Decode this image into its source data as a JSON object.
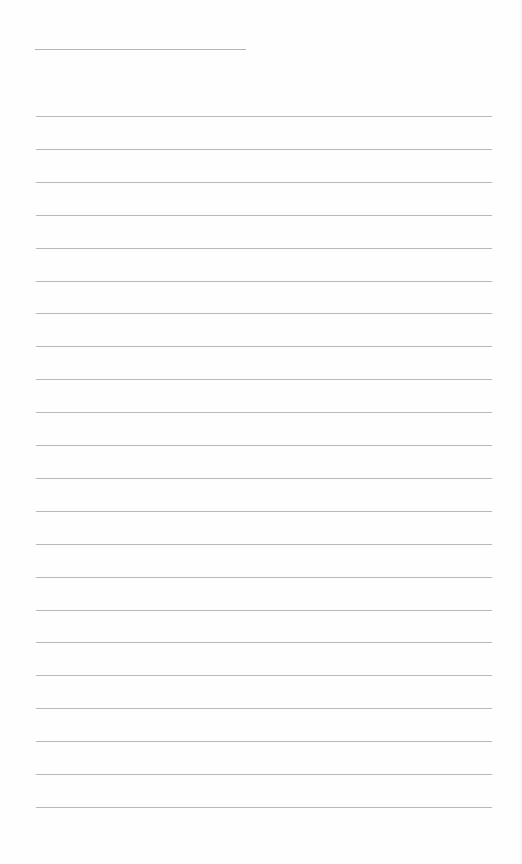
{
  "document": {
    "type": "lined-writing-sheet",
    "title_line": {
      "x": 35,
      "y": 49,
      "width": 211
    },
    "rules": {
      "count": 22,
      "start_y": 116,
      "spacing": 32.9,
      "x": 36,
      "width": 456,
      "color": "#b8b8b8"
    },
    "background": "#fefefe"
  }
}
